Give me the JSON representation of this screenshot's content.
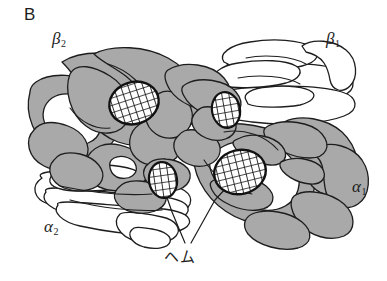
{
  "figure": {
    "panel_letter": "B",
    "caption_text": "",
    "background_color": "#ffffff",
    "ink_color": "#1d1d1d",
    "subunit_fill_shaded": "#a9a9a9",
    "subunit_fill_plain": "#ffffff",
    "heme_fill": "#ffffff",
    "heme_grid_color": "#111111",
    "width": 387,
    "height": 281
  },
  "labels": {
    "panel": "B",
    "beta2": {
      "symbol": "β",
      "subscript": "2",
      "x": 52,
      "y": 36
    },
    "beta1": {
      "symbol": "β",
      "subscript": "1",
      "x": 326,
      "y": 36
    },
    "alpha1": {
      "symbol": "α",
      "subscript": "1",
      "x": 352,
      "y": 184
    },
    "alpha2": {
      "symbol": "α",
      "subscript": "2",
      "x": 44,
      "y": 224
    },
    "heme": {
      "text": "ヘム",
      "x": 164,
      "y": 250
    }
  },
  "subunits": [
    {
      "name": "beta2",
      "label": "β2",
      "shading": "shaded",
      "position": "upper-left"
    },
    {
      "name": "beta1",
      "label": "β1",
      "shading": "plain",
      "position": "upper-right"
    },
    {
      "name": "alpha1",
      "label": "α1",
      "shading": "shaded",
      "position": "lower-right"
    },
    {
      "name": "alpha2",
      "label": "α2",
      "shading": "plain",
      "position": "lower-left"
    }
  ],
  "heme_groups": [
    {
      "id": "heme-beta2",
      "cx": 134,
      "cy": 103,
      "rx": 25,
      "ry": 21,
      "rotation": -18,
      "subunit": "beta2"
    },
    {
      "id": "heme-beta1",
      "cx": 226,
      "cy": 110,
      "rx": 14,
      "ry": 18,
      "rotation": -10,
      "subunit": "beta1"
    },
    {
      "id": "heme-alpha2",
      "cx": 163,
      "cy": 180,
      "rx": 14,
      "ry": 18,
      "rotation": -8,
      "subunit": "alpha2"
    },
    {
      "id": "heme-alpha1",
      "cx": 240,
      "cy": 172,
      "rx": 26,
      "ry": 22,
      "rotation": -14,
      "subunit": "alpha1"
    }
  ],
  "leader_lines": [
    {
      "from": "heme-label",
      "to": "heme-alpha2",
      "points": "185,243 172,212 163,186"
    },
    {
      "from": "heme-label",
      "to": "heme-alpha1",
      "points": "191,243 215,200 238,175"
    }
  ]
}
